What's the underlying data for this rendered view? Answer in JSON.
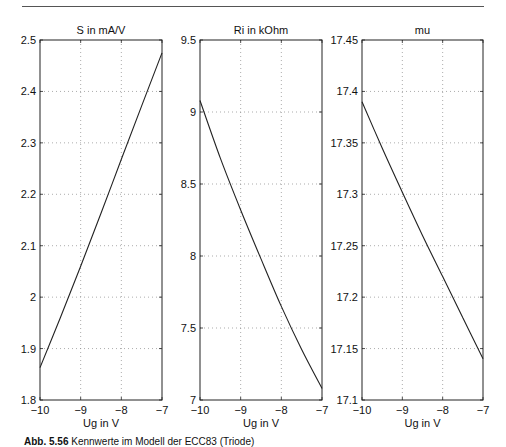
{
  "page": {
    "header_left": "5.3 Röhren-Modelle",
    "header_right": "487"
  },
  "caption": {
    "label": "Abb. 5.56",
    "text": "Kennwerte im Modell der ECC83 (Triode)"
  },
  "chart_data": [
    {
      "type": "line",
      "title": "S in mA/V",
      "xlabel": "Ug in V",
      "ylabel": "",
      "xlim": [
        -10,
        -7
      ],
      "ylim": [
        1.8,
        2.5
      ],
      "xticks": [
        -10,
        -9,
        -8,
        -7
      ],
      "xtick_labels": [
        "−10",
        "−9",
        "−8",
        "−7"
      ],
      "yticks": [
        1.8,
        1.9,
        2.0,
        2.1,
        2.2,
        2.3,
        2.4,
        2.5
      ],
      "ytick_labels": [
        "1.8",
        "1.9",
        "2",
        "2.1",
        "2.2",
        "2.3",
        "2.4",
        "2.5"
      ],
      "grid": true,
      "series": [
        {
          "name": "S",
          "x": [
            -10,
            -9.5,
            -9,
            -8.5,
            -8,
            -7.5,
            -7
          ],
          "y": [
            1.863,
            1.96,
            2.06,
            2.163,
            2.268,
            2.372,
            2.475
          ]
        }
      ]
    },
    {
      "type": "line",
      "title": "Ri in kOhm",
      "xlabel": "Ug in V",
      "ylabel": "",
      "xlim": [
        -10,
        -7
      ],
      "ylim": [
        7,
        9.5
      ],
      "xticks": [
        -10,
        -9,
        -8,
        -7
      ],
      "xtick_labels": [
        "−10",
        "−9",
        "−8",
        "−7"
      ],
      "yticks": [
        7,
        7.5,
        8,
        8.5,
        9,
        9.5
      ],
      "ytick_labels": [
        "7",
        "7.5",
        "8",
        "8.5",
        "9",
        "9.5"
      ],
      "grid": true,
      "series": [
        {
          "name": "Ri",
          "x": [
            -10,
            -9.5,
            -9,
            -8.5,
            -8,
            -7.5,
            -7
          ],
          "y": [
            9.08,
            8.68,
            8.32,
            7.98,
            7.65,
            7.35,
            7.08
          ]
        }
      ]
    },
    {
      "type": "line",
      "title": "mu",
      "xlabel": "Ug in V",
      "ylabel": "",
      "xlim": [
        -10,
        -7
      ],
      "ylim": [
        17.1,
        17.45
      ],
      "xticks": [
        -10,
        -9,
        -8,
        -7
      ],
      "xtick_labels": [
        "−10",
        "−9",
        "−8",
        "−7"
      ],
      "yticks": [
        17.1,
        17.15,
        17.2,
        17.25,
        17.3,
        17.35,
        17.4,
        17.45
      ],
      "ytick_labels": [
        "17.1",
        "17.15",
        "17.2",
        "17.25",
        "17.3",
        "17.35",
        "17.4",
        "17.45"
      ],
      "grid": true,
      "series": [
        {
          "name": "mu",
          "x": [
            -10,
            -9.5,
            -9,
            -8.5,
            -8,
            -7.5,
            -7
          ],
          "y": [
            17.39,
            17.345,
            17.302,
            17.26,
            17.22,
            17.18,
            17.14
          ]
        }
      ]
    }
  ]
}
